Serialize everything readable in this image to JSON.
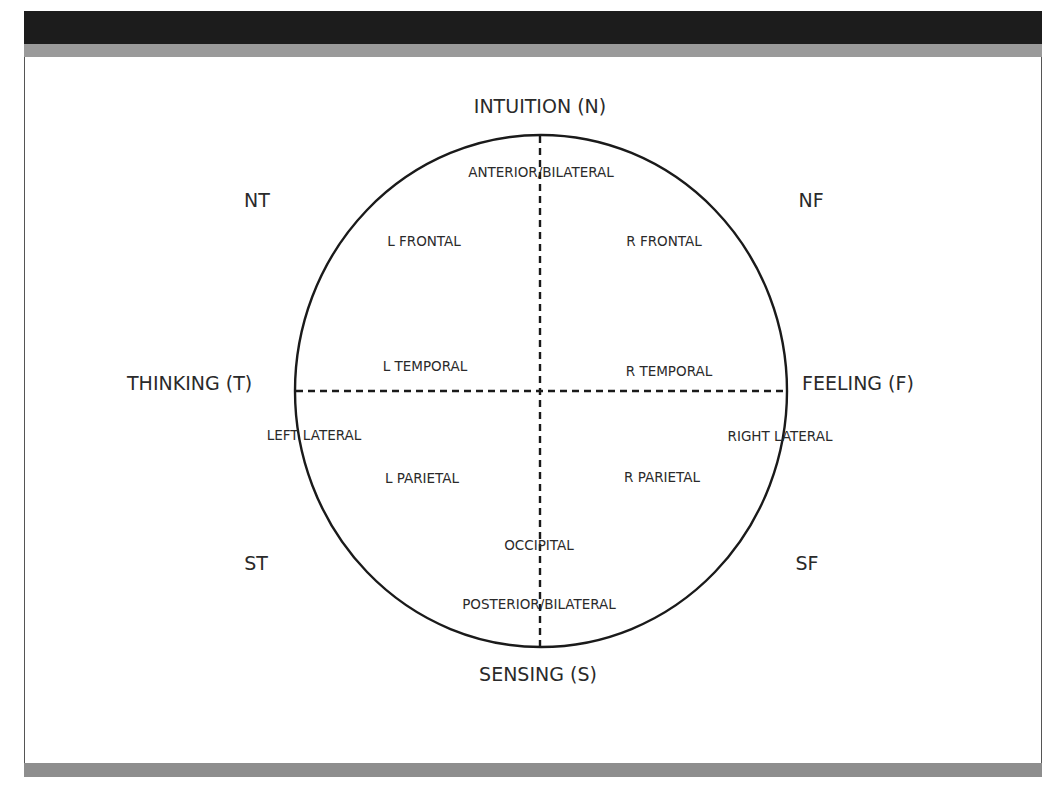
{
  "figure": {
    "axes": {
      "top": "INTUITION (N)",
      "bottom": "SENSING (S)",
      "left": "THINKING (T)",
      "right": "FEELING (F)"
    },
    "quadrants": {
      "top_left": "NT",
      "top_right": "NF",
      "bottom_left": "ST",
      "bottom_right": "SF"
    },
    "regions": {
      "anterior": "ANTERIOR/BILATERAL",
      "l_frontal": "L FRONTAL",
      "r_frontal": "R FRONTAL",
      "l_temporal": "L TEMPORAL",
      "r_temporal": "R TEMPORAL",
      "left_lateral": "LEFT LATERAL",
      "right_lateral": "RIGHT LATERAL",
      "l_parietal": "L PARIETAL",
      "r_parietal": "R PARIETAL",
      "occipital": "OCCIPITAL",
      "posterior": "POSTERIOR/BILATERAL"
    },
    "colors": {
      "header_dark": "#1c1c1c",
      "header_gray": "#9a9a9a",
      "footer_gray": "#8e8e8e",
      "line": "#1a1a1a"
    }
  }
}
